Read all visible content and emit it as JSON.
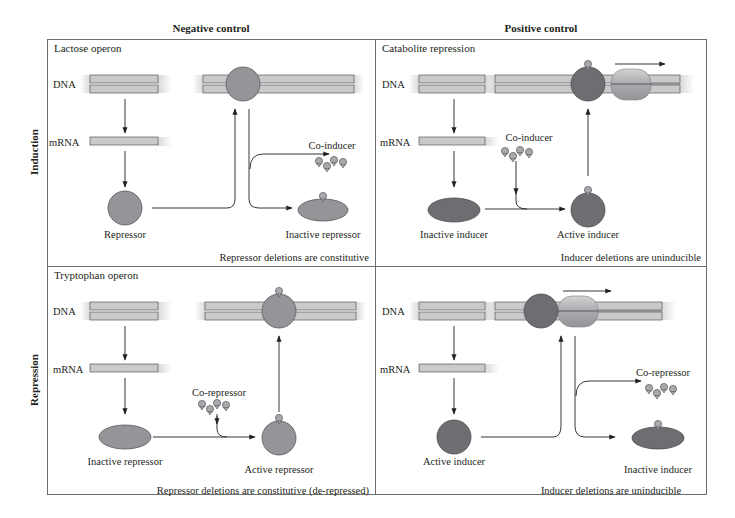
{
  "figure": {
    "column_headers": [
      "Negative control",
      "Positive control"
    ],
    "row_headers": [
      "Induction",
      "Repression"
    ],
    "colors": {
      "border": "#6d6e71",
      "dna_fill": "#c9cacc",
      "dna_stroke": "#58595b",
      "repressor_fill": "#939598",
      "inducer_fill": "#6d6e71",
      "ligand_fill": "#a7a9ac",
      "polymerase_fill": "#b1b3b6",
      "arrow": "#231f20"
    },
    "panels": [
      {
        "id": "lactose",
        "title": "Lactose operon",
        "dna_label": "DNA",
        "mrna_label": "mRNA",
        "protein_label": "Repressor",
        "ligand_label": "Co-inducer",
        "product_label": "Inactive repressor",
        "note": "Repressor deletions are constitutive"
      },
      {
        "id": "catabolite",
        "title": "Catabolite repression",
        "dna_label": "DNA",
        "mrna_label": "mRNA",
        "protein_label": "Inactive inducer",
        "ligand_label": "Co-inducer",
        "product_label": "Active inducer",
        "note": "Inducer deletions are uninducible"
      },
      {
        "id": "tryptophan",
        "title": "Tryptophan operon",
        "dna_label": "DNA",
        "mrna_label": "mRNA",
        "protein_label": "Inactive repressor",
        "ligand_label": "Co-repressor",
        "product_label": "Active repressor",
        "note": "Repressor deletions are constitutive (de-repressed)"
      },
      {
        "id": "positive-repression",
        "title": "",
        "dna_label": "DNA",
        "mrna_label": "mRNA",
        "protein_label": "Active inducer",
        "ligand_label": "Co-repressor",
        "product_label": "Inactive inducer",
        "note": "Inducer deletions are uninducible"
      }
    ]
  }
}
